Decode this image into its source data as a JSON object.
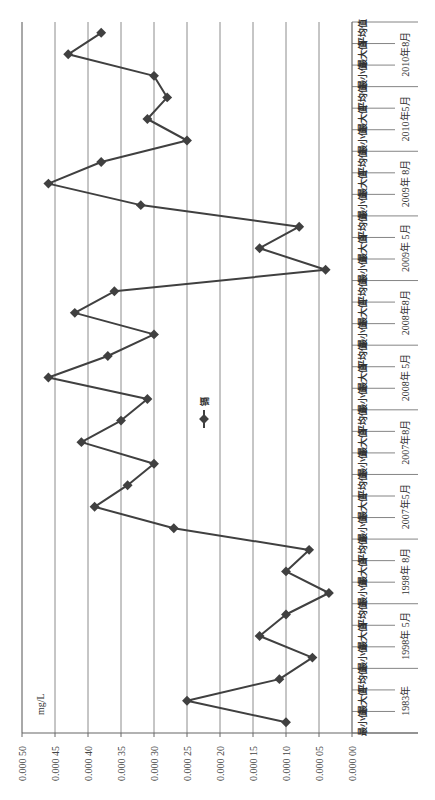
{
  "chart_data": {
    "type": "line",
    "orientation": "rotated-90-ccw",
    "title": "",
    "xlabel": "",
    "ylabel": "mg/L",
    "ylim": [
      0,
      0.0005
    ],
    "y_ticks": [
      "0.000 00",
      "0.000 05",
      "0.000 10",
      "0.000 15",
      "0.000 20",
      "0.000 25",
      "0.000 30",
      "0.000 35",
      "0.000 40",
      "0.000 45",
      "0.000 50"
    ],
    "grid": true,
    "legend_position": "center",
    "groups": [
      "1983年",
      "1998年 5月",
      "1998年 8月",
      "2007年5月",
      "2007年8月",
      "2008年 5月",
      "2008年8月",
      "2009年 5月",
      "2009年 8月",
      "2010年5月",
      "2010年8月"
    ],
    "sub_categories": [
      "最小值",
      "最大值",
      "平均值"
    ],
    "categories": [
      "1983年 最小值",
      "1983年 最大值",
      "1983年 平均值",
      "1998年5月 最小值",
      "1998年5月 最大值",
      "1998年5月 平均值",
      "1998年8月 最小值",
      "1998年8月 最大值",
      "1998年8月 平均值",
      "2007年5月 最小值",
      "2007年5月 最大值",
      "2007年5月 平均值",
      "2007年8月 最小值",
      "2007年8月 最大值",
      "2007年8月 平均值",
      "2008年5月 最小值",
      "2008年5月 最大值",
      "2008年5月 平均值",
      "2008年8月 最小值",
      "2008年8月 最大值",
      "2008年8月 平均值",
      "2009年5月 最小值",
      "2009年5月 最大值",
      "2009年5月 平均值",
      "2009年8月 最小值",
      "2009年8月 最大值",
      "2009年8月 平均值",
      "2010年5月 最小值",
      "2010年5月 最大值",
      "2010年5月 平均值",
      "2010年8月 最小值",
      "2010年8月 最大值",
      "2010年8月 平均值"
    ],
    "series": [
      {
        "name": "镉",
        "color": "#404040",
        "marker": "diamond",
        "values": [
          0.0001,
          0.00025,
          0.00011,
          6e-05,
          0.00014,
          0.0001,
          3.5e-05,
          0.0001,
          6.5e-05,
          0.00027,
          0.00039,
          0.00034,
          0.0003,
          0.00041,
          0.00035,
          0.00031,
          0.00046,
          0.00037,
          0.0003,
          0.00042,
          0.00036,
          4e-05,
          0.00014,
          8e-05,
          0.00032,
          0.00046,
          0.00038,
          0.00025,
          0.00031,
          0.00028,
          0.0003,
          0.00043,
          0.00038
        ]
      }
    ]
  },
  "legend": {
    "label": "镉"
  },
  "unit_label": "mg/L",
  "colors": {
    "line": "#404040",
    "grid": "#8c8c8c",
    "axis": "#666666",
    "background": "#ffffff"
  }
}
